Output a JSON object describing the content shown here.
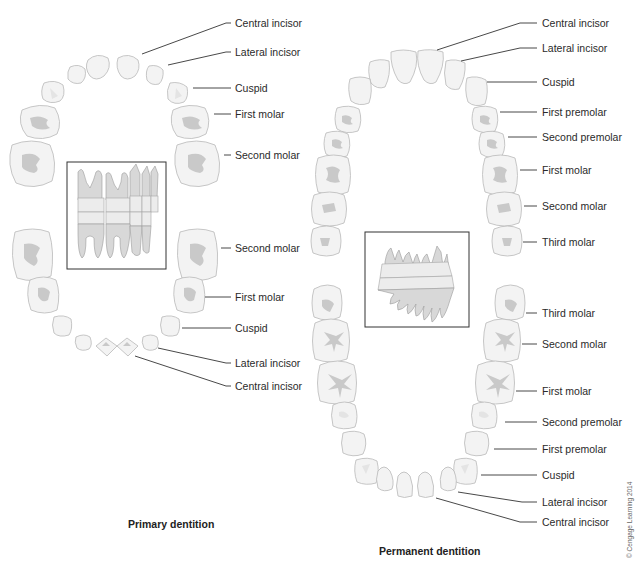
{
  "figure": {
    "primary": {
      "caption": "Primary dentition",
      "upper_labels": [
        "Central incisor",
        "Lateral incisor",
        "Cuspid",
        "First molar",
        "Second molar"
      ],
      "lower_labels": [
        "Second molar",
        "First molar",
        "Cuspid",
        "Lateral incisor",
        "Central incisor"
      ],
      "inset": "primary-teeth-lateral-view"
    },
    "permanent": {
      "caption": "Permanent dentition",
      "upper_labels": [
        "Central incisor",
        "Lateral incisor",
        "Cuspid",
        "First premolar",
        "Second premolar",
        "First molar",
        "Second molar",
        "Third molar"
      ],
      "lower_labels": [
        "Third molar",
        "Second molar",
        "First molar",
        "Second premolar",
        "First premolar",
        "Cuspid",
        "Lateral incisor",
        "Central incisor"
      ],
      "inset": "permanent-teeth-lateral-view"
    },
    "copyright": "© Cengage Learning 2014"
  }
}
